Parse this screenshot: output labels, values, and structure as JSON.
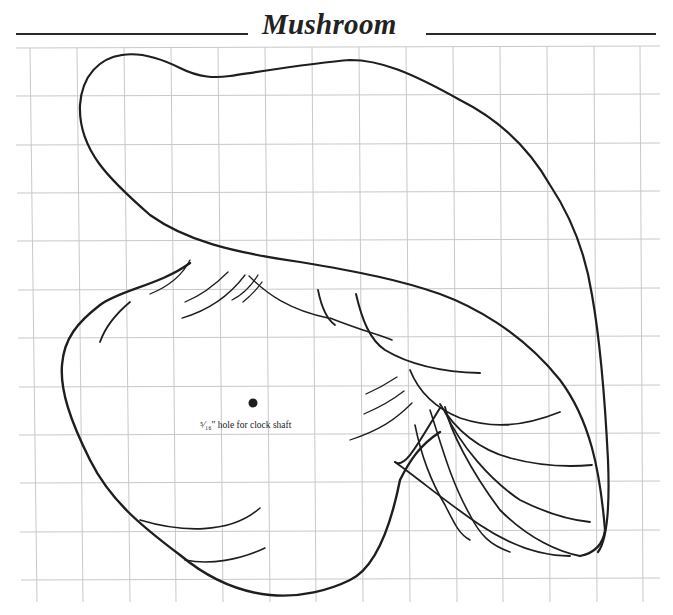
{
  "header": {
    "title": "Mushroom"
  },
  "pattern": {
    "grid_color": "#c8c8c8",
    "line_color": "#1e1e1e",
    "hole_label": "⁵⁄₁₆\" hole for clock shaft"
  }
}
